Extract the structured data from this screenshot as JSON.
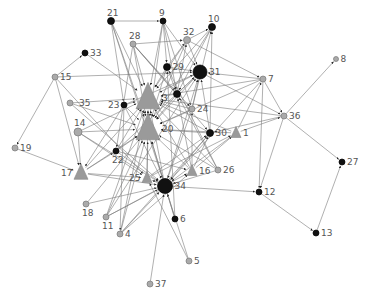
{
  "diagram": {
    "type": "directed-network",
    "edge_color": "#7a7a7a",
    "colors": {
      "black_node": "#111111",
      "grey_node": "#aaaaaa",
      "grey_node_stroke": "#777777",
      "triangle": "#9a9a9a"
    },
    "nodes": [
      {
        "id": "1",
        "x": 236,
        "y": 133,
        "shape": "triangle",
        "size": 5,
        "color": "grey"
      },
      {
        "id": "3",
        "x": 148,
        "y": 98,
        "shape": "triangle",
        "size": 12,
        "color": "grey"
      },
      {
        "id": "4",
        "x": 120,
        "y": 234,
        "shape": "circle",
        "size": 3,
        "color": "grey"
      },
      {
        "id": "5",
        "x": 189,
        "y": 261,
        "shape": "circle",
        "size": 3,
        "color": "grey"
      },
      {
        "id": "6",
        "x": 175,
        "y": 219,
        "shape": "circle",
        "size": 3,
        "color": "black"
      },
      {
        "id": "7",
        "x": 263,
        "y": 79,
        "shape": "circle",
        "size": 3,
        "color": "grey"
      },
      {
        "id": "8",
        "x": 336,
        "y": 59,
        "shape": "circle",
        "size": 2.5,
        "color": "grey"
      },
      {
        "id": "9",
        "x": 163,
        "y": 21,
        "shape": "circle",
        "size": 3,
        "color": "black"
      },
      {
        "id": "10",
        "x": 212,
        "y": 27,
        "shape": "circle",
        "size": 3.5,
        "color": "black"
      },
      {
        "id": "11",
        "x": 106,
        "y": 217,
        "shape": "circle",
        "size": 3,
        "color": "grey"
      },
      {
        "id": "12",
        "x": 259,
        "y": 192,
        "shape": "circle",
        "size": 3,
        "color": "black"
      },
      {
        "id": "13",
        "x": 316,
        "y": 233,
        "shape": "circle",
        "size": 3,
        "color": "black"
      },
      {
        "id": "14",
        "x": 78,
        "y": 132,
        "shape": "circle",
        "size": 4,
        "color": "grey"
      },
      {
        "id": "15",
        "x": 55,
        "y": 77,
        "shape": "circle",
        "size": 3,
        "color": "grey"
      },
      {
        "id": "16",
        "x": 192,
        "y": 171,
        "shape": "triangle",
        "size": 5,
        "color": "grey"
      },
      {
        "id": "17",
        "x": 81,
        "y": 173,
        "shape": "triangle",
        "size": 7,
        "color": "grey"
      },
      {
        "id": "18",
        "x": 86,
        "y": 204,
        "shape": "circle",
        "size": 3,
        "color": "grey"
      },
      {
        "id": "19",
        "x": 15,
        "y": 148,
        "shape": "circle",
        "size": 3,
        "color": "grey"
      },
      {
        "id": "20",
        "x": 148,
        "y": 129,
        "shape": "triangle",
        "size": 12,
        "color": "grey"
      },
      {
        "id": "21",
        "x": 111,
        "y": 21,
        "shape": "circle",
        "size": 3.5,
        "color": "black"
      },
      {
        "id": "22",
        "x": 116,
        "y": 151,
        "shape": "circle",
        "size": 3,
        "color": "black"
      },
      {
        "id": "23",
        "x": 124,
        "y": 105,
        "shape": "circle",
        "size": 3,
        "color": "black"
      },
      {
        "id": "24",
        "x": 192,
        "y": 109,
        "shape": "circle",
        "size": 3,
        "color": "grey"
      },
      {
        "id": "25",
        "x": 147,
        "y": 178,
        "shape": "triangle",
        "size": 5,
        "color": "grey"
      },
      {
        "id": "26",
        "x": 218,
        "y": 170,
        "shape": "circle",
        "size": 3,
        "color": "grey"
      },
      {
        "id": "27",
        "x": 342,
        "y": 162,
        "shape": "circle",
        "size": 3,
        "color": "black"
      },
      {
        "id": "28",
        "x": 133,
        "y": 44,
        "shape": "circle",
        "size": 3,
        "color": "grey"
      },
      {
        "id": "29",
        "x": 167,
        "y": 67,
        "shape": "circle",
        "size": 3.5,
        "color": "black"
      },
      {
        "id": "30",
        "x": 210,
        "y": 133,
        "shape": "circle",
        "size": 3.5,
        "color": "black"
      },
      {
        "id": "31",
        "x": 200,
        "y": 72,
        "shape": "circle",
        "size": 7,
        "color": "black"
      },
      {
        "id": "32",
        "x": 187,
        "y": 40,
        "shape": "circle",
        "size": 3.5,
        "color": "grey"
      },
      {
        "id": "33",
        "x": 85,
        "y": 53,
        "shape": "circle",
        "size": 3,
        "color": "black"
      },
      {
        "id": "34",
        "x": 165,
        "y": 186,
        "shape": "circle",
        "size": 7.5,
        "color": "black"
      },
      {
        "id": "35",
        "x": 70,
        "y": 103,
        "shape": "circle",
        "size": 3,
        "color": "grey"
      },
      {
        "id": "36",
        "x": 284,
        "y": 116,
        "shape": "circle",
        "size": 3,
        "color": "grey"
      },
      {
        "id": "37",
        "x": 150,
        "y": 284,
        "shape": "circle",
        "size": 3,
        "color": "grey"
      },
      {
        "id": "x1",
        "x": 177,
        "y": 94,
        "shape": "circle",
        "size": 3.5,
        "color": "black",
        "unlabeled": true
      }
    ],
    "edges": [
      [
        "21",
        "9"
      ],
      [
        "21",
        "3"
      ],
      [
        "21",
        "20"
      ],
      [
        "21",
        "34"
      ],
      [
        "21",
        "23"
      ],
      [
        "9",
        "3"
      ],
      [
        "9",
        "20"
      ],
      [
        "9",
        "31"
      ],
      [
        "9",
        "29"
      ],
      [
        "9",
        "x1"
      ],
      [
        "9",
        "24"
      ],
      [
        "28",
        "32"
      ],
      [
        "28",
        "3"
      ],
      [
        "28",
        "20"
      ],
      [
        "28",
        "x1"
      ],
      [
        "28",
        "24"
      ],
      [
        "28",
        "30"
      ],
      [
        "28",
        "22"
      ],
      [
        "33",
        "3"
      ],
      [
        "15",
        "33"
      ],
      [
        "15",
        "31"
      ],
      [
        "15",
        "19"
      ],
      [
        "15",
        "17"
      ],
      [
        "15",
        "25"
      ],
      [
        "35",
        "3"
      ],
      [
        "35",
        "20"
      ],
      [
        "35",
        "34"
      ],
      [
        "23",
        "3"
      ],
      [
        "23",
        "20"
      ],
      [
        "23",
        "34"
      ],
      [
        "23",
        "31"
      ],
      [
        "23",
        "17"
      ],
      [
        "23",
        "4"
      ],
      [
        "14",
        "20"
      ],
      [
        "14",
        "17"
      ],
      [
        "14",
        "3"
      ],
      [
        "14",
        "25"
      ],
      [
        "14",
        "34"
      ],
      [
        "19",
        "17"
      ],
      [
        "17",
        "22"
      ],
      [
        "17",
        "20"
      ],
      [
        "17",
        "34"
      ],
      [
        "17",
        "3"
      ],
      [
        "17",
        "25"
      ],
      [
        "18",
        "20"
      ],
      [
        "18",
        "34"
      ],
      [
        "11",
        "3"
      ],
      [
        "11",
        "20"
      ],
      [
        "11",
        "34"
      ],
      [
        "11",
        "31"
      ],
      [
        "11",
        "16"
      ],
      [
        "4",
        "34"
      ],
      [
        "4",
        "3"
      ],
      [
        "4",
        "20"
      ],
      [
        "4",
        "30"
      ],
      [
        "4",
        "16"
      ],
      [
        "37",
        "34"
      ],
      [
        "5",
        "34"
      ],
      [
        "5",
        "25"
      ],
      [
        "6",
        "34"
      ],
      [
        "6",
        "29"
      ],
      [
        "6",
        "20"
      ],
      [
        "34",
        "25"
      ],
      [
        "34",
        "3"
      ],
      [
        "34",
        "20"
      ],
      [
        "34",
        "31"
      ],
      [
        "34",
        "12"
      ],
      [
        "22",
        "3"
      ],
      [
        "22",
        "20"
      ],
      [
        "22",
        "31"
      ],
      [
        "22",
        "16"
      ],
      [
        "22",
        "34"
      ],
      [
        "25",
        "3"
      ],
      [
        "25",
        "20"
      ],
      [
        "25",
        "30"
      ],
      [
        "25",
        "1"
      ],
      [
        "16",
        "3"
      ],
      [
        "16",
        "20"
      ],
      [
        "16",
        "x1"
      ],
      [
        "16",
        "1"
      ],
      [
        "16",
        "30"
      ],
      [
        "16",
        "24"
      ],
      [
        "26",
        "3"
      ],
      [
        "26",
        "20"
      ],
      [
        "26",
        "x1"
      ],
      [
        "26",
        "34"
      ],
      [
        "26",
        "29"
      ],
      [
        "30",
        "31"
      ],
      [
        "30",
        "3"
      ],
      [
        "30",
        "20"
      ],
      [
        "30",
        "10"
      ],
      [
        "30",
        "34"
      ],
      [
        "1",
        "3"
      ],
      [
        "1",
        "20"
      ],
      [
        "1",
        "7"
      ],
      [
        "1",
        "36"
      ],
      [
        "1",
        "34"
      ],
      [
        "24",
        "3"
      ],
      [
        "24",
        "20"
      ],
      [
        "24",
        "31"
      ],
      [
        "24",
        "10"
      ],
      [
        "24",
        "34"
      ],
      [
        "29",
        "3"
      ],
      [
        "29",
        "20"
      ],
      [
        "29",
        "31"
      ],
      [
        "29",
        "x1"
      ],
      [
        "29",
        "32"
      ],
      [
        "x1",
        "31"
      ],
      [
        "x1",
        "3"
      ],
      [
        "x1",
        "20"
      ],
      [
        "x1",
        "32"
      ],
      [
        "32",
        "3"
      ],
      [
        "32",
        "20"
      ],
      [
        "32",
        "10"
      ],
      [
        "32",
        "7"
      ],
      [
        "32",
        "31"
      ],
      [
        "10",
        "3"
      ],
      [
        "10",
        "20"
      ],
      [
        "10",
        "x1"
      ],
      [
        "31",
        "3"
      ],
      [
        "31",
        "20"
      ],
      [
        "31",
        "36"
      ],
      [
        "7",
        "31"
      ],
      [
        "7",
        "36"
      ],
      [
        "7",
        "12"
      ],
      [
        "7",
        "20"
      ],
      [
        "7",
        "3"
      ],
      [
        "7",
        "34"
      ],
      [
        "36",
        "8"
      ],
      [
        "36",
        "12"
      ],
      [
        "36",
        "27"
      ],
      [
        "36",
        "30"
      ],
      [
        "36",
        "3"
      ],
      [
        "12",
        "13"
      ],
      [
        "13",
        "27"
      ],
      [
        "3",
        "20"
      ],
      [
        "20",
        "3"
      ]
    ]
  }
}
